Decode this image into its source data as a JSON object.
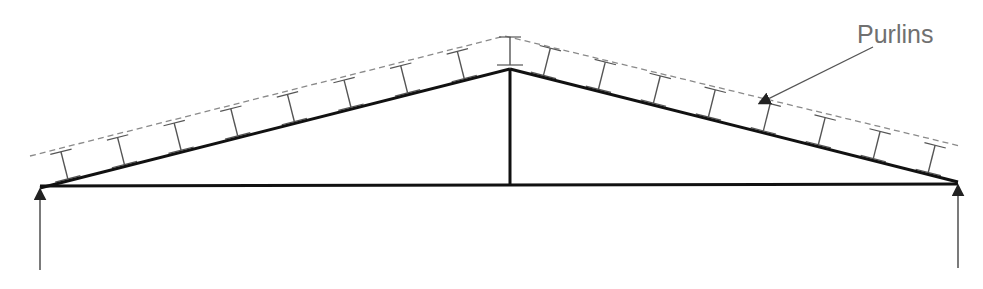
{
  "diagram": {
    "type": "roof-truss",
    "title": "",
    "labels": {
      "purlins": "Purlins"
    },
    "colors": {
      "truss": "#111111",
      "purlin": "#555555",
      "roof_sheet": "#8a8a8a",
      "label": "#707070",
      "reaction": "#333333"
    },
    "members": [
      "left-rafter",
      "right-rafter",
      "bottom-chord",
      "king-post"
    ],
    "purlin_count_left": 8,
    "purlin_count_right": 8,
    "purlin_at_apex": true,
    "supports": [
      "left-reaction",
      "right-reaction"
    ]
  }
}
